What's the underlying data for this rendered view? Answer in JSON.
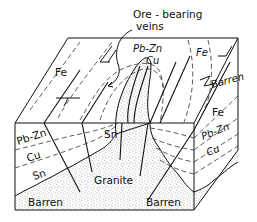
{
  "figure": {
    "type": "block-diagram",
    "callout": {
      "line1": "Ore - bearing",
      "line2": "veins"
    },
    "labels": {
      "top_fe_left": "Fe",
      "top_pbzn": "Pb-Zn",
      "top_cu": "Cu",
      "top_fe_right": "Fe",
      "right_barren": "Barren",
      "right_fe": "Fe",
      "right_pbzn": "Pb-Zn",
      "right_cu": "Cu",
      "front_pbzn": "Pb-Zn",
      "front_cu": "Cu",
      "front_sn_left": "Sn",
      "front_sn_center": "Sn",
      "granite": "Granite",
      "barren_left": "Barren",
      "barren_right": "Barren"
    },
    "zones": [
      "Barren",
      "Sn",
      "Cu",
      "Pb-Zn",
      "Fe",
      "Barren"
    ],
    "colors": {
      "line": "#111111",
      "granite_stipple": "#555555",
      "background": "#ffffff"
    }
  }
}
